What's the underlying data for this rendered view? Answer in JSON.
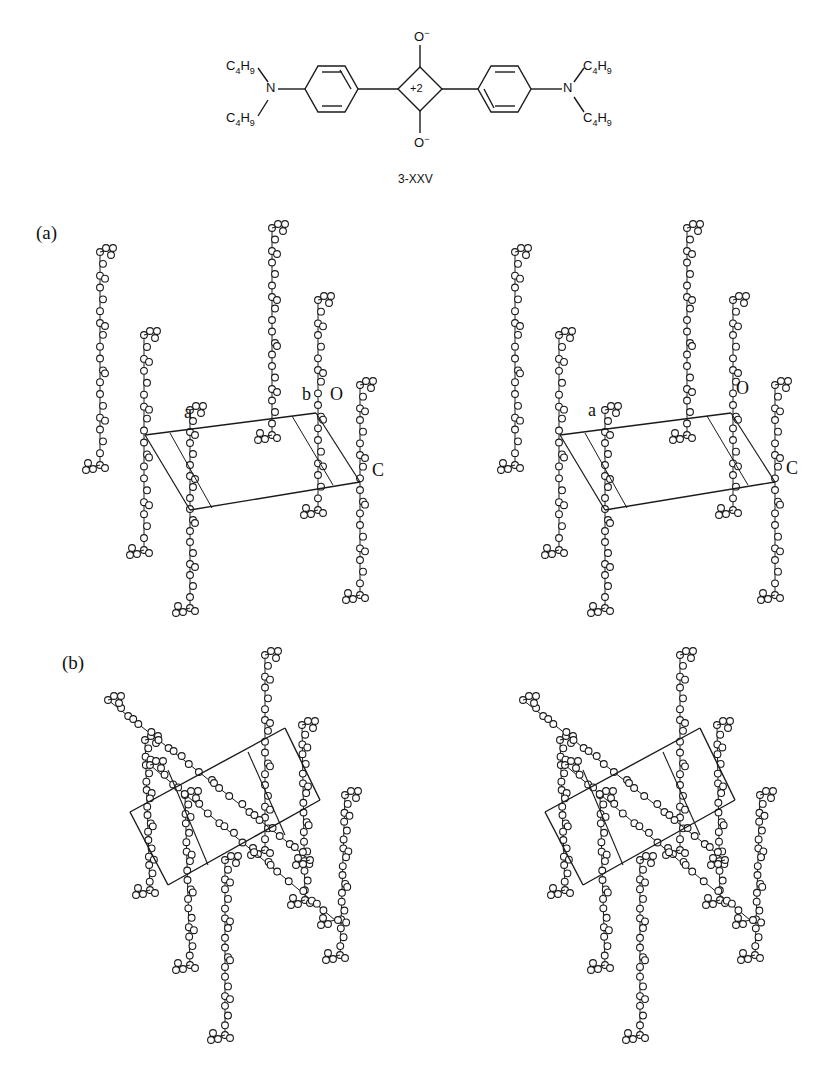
{
  "structure": {
    "compound_label": "3-XXV",
    "center_charge": "+2",
    "oxygen_top": "O",
    "oxygen_bottom": "O",
    "oxygen_charge": "−",
    "nitrogen": "N",
    "substituents": [
      "C4H9",
      "C4H9",
      "C4H9",
      "C4H9"
    ]
  },
  "panels": [
    {
      "id": "a",
      "label": "(a)",
      "axis_labels": {
        "a": "a",
        "b": "b",
        "c": "C",
        "origin": "O"
      }
    },
    {
      "id": "b",
      "label": "(b)"
    }
  ],
  "colors": {
    "ink": "#1a1a1a",
    "paper": "#ffffff"
  }
}
